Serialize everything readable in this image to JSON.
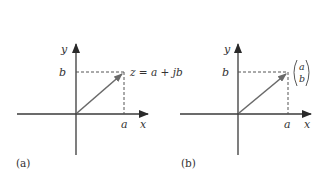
{
  "panels": [
    {
      "id": "a",
      "caption": "(a)",
      "x_axis_label": "x",
      "y_axis_label": "y",
      "x_tick_label": "a",
      "y_tick_label": "b",
      "point_label": "z = a + jb"
    },
    {
      "id": "b",
      "caption": "(b)",
      "x_axis_label": "x",
      "y_axis_label": "y",
      "x_tick_label": "a",
      "y_tick_label": "b",
      "vector_top": "a",
      "vector_bottom": "b"
    }
  ],
  "colors": {
    "axis": "#3a3a3a",
    "vector": "#6a6a6a",
    "dashed": "#555555",
    "text": "#333333"
  }
}
